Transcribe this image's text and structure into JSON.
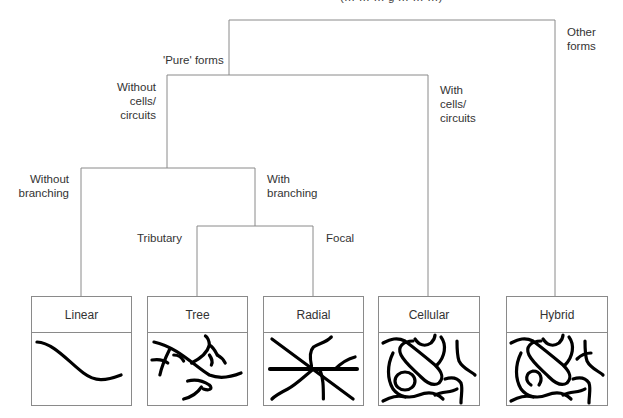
{
  "title_fragment": "(… … … g … … …)",
  "labels": {
    "pure_forms": "'Pure' forms",
    "other_forms_1": "Other",
    "other_forms_2": "forms",
    "without_cells_1": "Without",
    "without_cells_2": "cells/",
    "without_cells_3": "circuits",
    "with_cells_1": "With",
    "with_cells_2": "cells/",
    "with_cells_3": "circuits",
    "without_branching_1": "Without",
    "without_branching_2": "branching",
    "with_branching_1": "With",
    "with_branching_2": "branching",
    "tributary": "Tributary",
    "focal": "Focal"
  },
  "boxes": [
    {
      "id": "linear",
      "label": "Linear"
    },
    {
      "id": "tree",
      "label": "Tree"
    },
    {
      "id": "radial",
      "label": "Radial"
    },
    {
      "id": "cellular",
      "label": "Cellular"
    },
    {
      "id": "hybrid",
      "label": "Hybrid"
    }
  ],
  "colors": {
    "line": "#8a8a8a",
    "stroke": "#000000"
  }
}
